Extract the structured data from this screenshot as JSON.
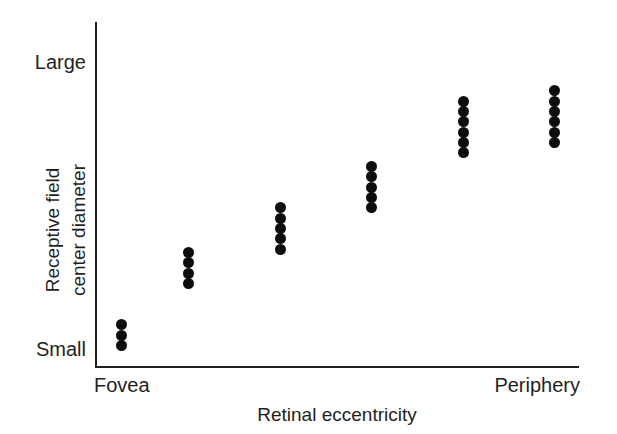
{
  "figure": {
    "background_color": "#ffffff",
    "axis_color": "#1f1f1f",
    "marker_color": "#0d0d0d"
  },
  "axes": {
    "y_title_line_1": "Receptive field",
    "y_title_line_2": "center diameter",
    "y_tick_top": "Large",
    "y_tick_bottom": "Small",
    "x_title": "Retinal eccentricity",
    "x_tick_left": "Fovea",
    "x_tick_right": "Periphery"
  },
  "chart_data": {
    "type": "scatter",
    "title": "",
    "xlabel": "Retinal eccentricity",
    "ylabel": "Receptive field center diameter",
    "xlim": [
      0,
      100
    ],
    "ylim": [
      0,
      100
    ],
    "grid": false,
    "legend": "none",
    "xtick_labels": [
      "Fovea",
      "Periphery"
    ],
    "xtick_values": [
      0,
      100
    ],
    "ytick_labels": [
      "Small",
      "Large"
    ],
    "ytick_values": [
      5,
      90
    ],
    "annotations": [],
    "series": [
      {
        "name": "Receptive field centers",
        "marker": "filled-circle",
        "color": "#0d0d0d",
        "clusters": [
          {
            "label": "cluster-1",
            "x": 5,
            "n": 3,
            "y_values": [
              6,
              9,
              12
            ]
          },
          {
            "label": "cluster-2",
            "x": 19,
            "n": 4,
            "y_values": [
              24,
              27,
              30,
              33
            ]
          },
          {
            "label": "cluster-3",
            "x": 38,
            "n": 5,
            "y_values": [
              34,
              37,
              40,
              43,
              46
            ]
          },
          {
            "label": "cluster-4",
            "x": 57,
            "n": 5,
            "y_values": [
              46,
              49,
              52,
              55,
              58
            ]
          },
          {
            "label": "cluster-5",
            "x": 76,
            "n": 6,
            "y_values": [
              62,
              65,
              68,
              71,
              74,
              77
            ]
          },
          {
            "label": "cluster-6",
            "x": 95,
            "n": 6,
            "y_values": [
              65,
              68,
              71,
              74,
              77,
              80
            ]
          }
        ]
      }
    ],
    "points": [
      {
        "x": 5,
        "y": 6
      },
      {
        "x": 5,
        "y": 9
      },
      {
        "x": 5,
        "y": 12
      },
      {
        "x": 19,
        "y": 24
      },
      {
        "x": 19,
        "y": 27
      },
      {
        "x": 19,
        "y": 30
      },
      {
        "x": 19,
        "y": 33
      },
      {
        "x": 38,
        "y": 34
      },
      {
        "x": 38,
        "y": 37
      },
      {
        "x": 38,
        "y": 40
      },
      {
        "x": 38,
        "y": 43
      },
      {
        "x": 38,
        "y": 46
      },
      {
        "x": 57,
        "y": 46
      },
      {
        "x": 57,
        "y": 49
      },
      {
        "x": 57,
        "y": 52
      },
      {
        "x": 57,
        "y": 55
      },
      {
        "x": 57,
        "y": 58
      },
      {
        "x": 76,
        "y": 62
      },
      {
        "x": 76,
        "y": 65
      },
      {
        "x": 76,
        "y": 68
      },
      {
        "x": 76,
        "y": 71
      },
      {
        "x": 76,
        "y": 74
      },
      {
        "x": 76,
        "y": 77
      },
      {
        "x": 95,
        "y": 65
      },
      {
        "x": 95,
        "y": 68
      },
      {
        "x": 95,
        "y": 71
      },
      {
        "x": 95,
        "y": 74
      },
      {
        "x": 95,
        "y": 77
      },
      {
        "x": 95,
        "y": 80
      }
    ]
  }
}
